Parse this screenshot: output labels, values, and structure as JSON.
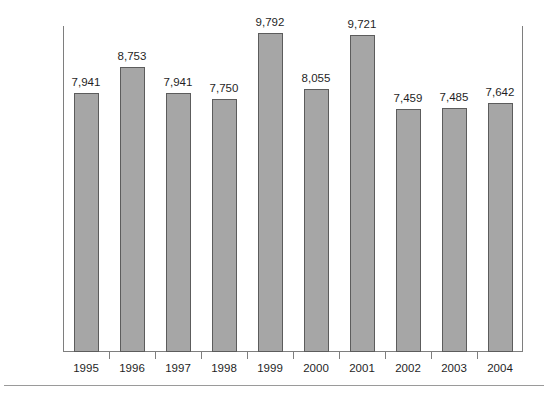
{
  "chart_data": {
    "type": "bar",
    "title": "",
    "subtitle": "",
    "xlabel": "",
    "ylabel": "",
    "categories": [
      "1995",
      "1996",
      "1997",
      "1998",
      "1999",
      "2000",
      "2001",
      "2002",
      "2003",
      "2004"
    ],
    "values": [
      7941,
      8753,
      7941,
      7750,
      9792,
      8055,
      9721,
      7459,
      7485,
      7642
    ],
    "value_labels": [
      "7,941",
      "8,753",
      "7,941",
      "7,750",
      "9,792",
      "8,055",
      "9,721",
      "7,459",
      "7,485",
      "7,642"
    ],
    "ylim": [
      0,
      10000
    ],
    "ytick_values": [
      0,
      1000,
      2000,
      3000,
      4000,
      5000,
      6000,
      7000,
      8000,
      9000,
      10000
    ],
    "ytick_labels": [
      "0",
      "1,000",
      "2,000",
      "3,000",
      "4,000",
      "5,000",
      "6,000",
      "7,000",
      "8,000",
      "9,000",
      "10,000"
    ],
    "grid": false,
    "legend": null,
    "bar_color": "#a6a6a6",
    "bar_edge_color": "#5c5c5c",
    "axis_color": "#7e7e7e",
    "background": "#ffffff",
    "data_labels_shown": true
  },
  "footer": {
    "caption": ""
  }
}
